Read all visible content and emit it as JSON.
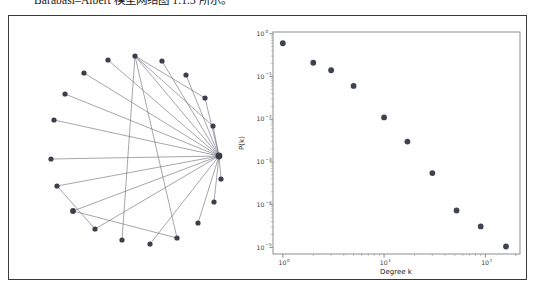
{
  "caption": {
    "text": "Barabási–Albert 模型网络图 1.1.3 所示。"
  },
  "figure": {
    "border_color": "#3a3a3a",
    "background": "#ffffff"
  },
  "network": {
    "title": "",
    "node_color": "#3a3f4a",
    "edge_color": "#6e6e78",
    "node_count": 20,
    "edge_count": 23,
    "nodes": [
      {
        "id": 0,
        "x": 210.0,
        "y": 140.0,
        "r": 3.4,
        "label": "hub"
      },
      {
        "id": 1,
        "x": 204.0,
        "y": 110.0,
        "r": 2.6,
        "label": "n1"
      },
      {
        "id": 2,
        "x": 196.0,
        "y": 82.0,
        "r": 2.6,
        "label": "n2"
      },
      {
        "id": 3,
        "x": 177.0,
        "y": 59.0,
        "r": 2.6,
        "label": "n3"
      },
      {
        "id": 4,
        "x": 153.0,
        "y": 45.0,
        "r": 2.6,
        "label": "n4"
      },
      {
        "id": 5,
        "x": 126.0,
        "y": 40.0,
        "r": 2.6,
        "label": "n5"
      },
      {
        "id": 6,
        "x": 99.0,
        "y": 44.0,
        "r": 2.6,
        "label": "n6"
      },
      {
        "id": 7,
        "x": 75.0,
        "y": 57.0,
        "r": 2.6,
        "label": "n7"
      },
      {
        "id": 8,
        "x": 56.0,
        "y": 78.0,
        "r": 2.6,
        "label": "n8"
      },
      {
        "id": 9,
        "x": 45.0,
        "y": 104.0,
        "r": 2.6,
        "label": "n9"
      },
      {
        "id": 10,
        "x": 42.0,
        "y": 143.0,
        "r": 2.6,
        "label": "n10"
      },
      {
        "id": 11,
        "x": 48.0,
        "y": 170.0,
        "r": 2.6,
        "label": "n11"
      },
      {
        "id": 12,
        "x": 64.0,
        "y": 195.0,
        "r": 2.9,
        "label": "n12"
      },
      {
        "id": 13,
        "x": 86.0,
        "y": 213.0,
        "r": 2.6,
        "label": "n13"
      },
      {
        "id": 14,
        "x": 113.0,
        "y": 224.0,
        "r": 2.6,
        "label": "n14"
      },
      {
        "id": 15,
        "x": 141.0,
        "y": 228.0,
        "r": 2.6,
        "label": "n15"
      },
      {
        "id": 16,
        "x": 168.0,
        "y": 222.0,
        "r": 2.6,
        "label": "n16"
      },
      {
        "id": 17,
        "x": 189.0,
        "y": 207.0,
        "r": 2.6,
        "label": "n17"
      },
      {
        "id": 18,
        "x": 205.0,
        "y": 186.0,
        "r": 2.6,
        "label": "n18"
      },
      {
        "id": 19,
        "x": 212.0,
        "y": 163.0,
        "r": 2.6,
        "label": "n19"
      }
    ],
    "edges": [
      [
        0,
        1
      ],
      [
        0,
        2
      ],
      [
        0,
        3
      ],
      [
        0,
        4
      ],
      [
        0,
        5
      ],
      [
        0,
        6
      ],
      [
        0,
        7
      ],
      [
        0,
        8
      ],
      [
        0,
        9
      ],
      [
        0,
        10
      ],
      [
        0,
        11
      ],
      [
        0,
        12
      ],
      [
        0,
        13
      ],
      [
        0,
        15
      ],
      [
        0,
        17
      ],
      [
        0,
        18
      ],
      [
        0,
        19
      ],
      [
        1,
        5
      ],
      [
        2,
        5
      ],
      [
        5,
        14
      ],
      [
        5,
        16
      ],
      [
        12,
        16
      ],
      [
        13,
        11
      ]
    ]
  },
  "chart_data": {
    "type": "scatter",
    "title": "",
    "xlabel": "Degree k",
    "ylabel": "P(k)",
    "xscale": "log",
    "yscale": "log",
    "xlim": [
      0.8,
      220
    ],
    "ylim": [
      7e-06,
      1.1
    ],
    "grid": false,
    "marker_color": "#3d4450",
    "x": [
      1,
      2,
      3,
      5,
      10,
      17,
      30,
      52,
      90,
      160
    ],
    "y": [
      0.6,
      0.21,
      0.14,
      0.06,
      0.011,
      0.003,
      0.00055,
      7.3e-05,
      3.1e-05,
      1.05e-05
    ],
    "xticks": [
      {
        "value": 1,
        "mantissa": "10",
        "exponent": "0"
      },
      {
        "value": 10,
        "mantissa": "10",
        "exponent": "1"
      },
      {
        "value": 100,
        "mantissa": "10",
        "exponent": "2"
      }
    ],
    "yticks": [
      {
        "value": 1,
        "mantissa": "10",
        "exponent": "0"
      },
      {
        "value": 0.1,
        "mantissa": "10",
        "exponent": "−1"
      },
      {
        "value": 0.01,
        "mantissa": "10",
        "exponent": "−2"
      },
      {
        "value": 0.001,
        "mantissa": "10",
        "exponent": "−3"
      },
      {
        "value": 0.0001,
        "mantissa": "10",
        "exponent": "−4"
      },
      {
        "value": 1e-05,
        "mantissa": "10",
        "exponent": "−5"
      }
    ]
  }
}
